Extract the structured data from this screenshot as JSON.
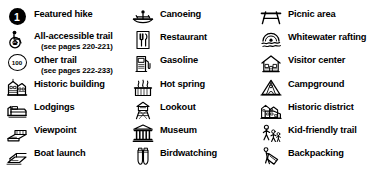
{
  "legend": {
    "background_color": "#ffffff",
    "text_color": "#000000",
    "columns": [
      {
        "name": "column-1",
        "entries": [
          {
            "icon": "featured-hike-badge-icon",
            "label": "Featured hike",
            "sublabel": "",
            "badge_text": "1",
            "y": 6
          },
          {
            "icon": "wheelchair-accessible-icon",
            "label": "All-accessible trail",
            "sublabel": "(see pages 220-221)",
            "badge_text": "",
            "y": 28
          },
          {
            "icon": "route-shield-icon",
            "label": "Other trail",
            "sublabel": "(see pages 222-233)",
            "badge_text": "100",
            "y": 52
          },
          {
            "icon": "historic-building-icon",
            "label": "Historic building",
            "sublabel": "",
            "badge_text": "",
            "y": 76
          },
          {
            "icon": "lodgings-bed-icon",
            "label": "Lodgings",
            "sublabel": "",
            "badge_text": "",
            "y": 99
          },
          {
            "icon": "viewpoint-icon",
            "label": "Viewpoint",
            "sublabel": "",
            "badge_text": "",
            "y": 122
          },
          {
            "icon": "boat-launch-icon",
            "label": "Boat launch",
            "sublabel": "",
            "badge_text": "",
            "y": 145
          }
        ]
      },
      {
        "name": "column-2",
        "entries": [
          {
            "icon": "canoeing-icon",
            "label": "Canoeing",
            "sublabel": "",
            "badge_text": "",
            "y": 6
          },
          {
            "icon": "restaurant-icon",
            "label": "Restaurant",
            "sublabel": "",
            "badge_text": "",
            "y": 29
          },
          {
            "icon": "gasoline-pump-icon",
            "label": "Gasoline",
            "sublabel": "",
            "badge_text": "",
            "y": 52
          },
          {
            "icon": "hot-spring-icon",
            "label": "Hot spring",
            "sublabel": "",
            "badge_text": "",
            "y": 76
          },
          {
            "icon": "lookout-tower-icon",
            "label": "Lookout",
            "sublabel": "",
            "badge_text": "",
            "y": 99
          },
          {
            "icon": "museum-icon",
            "label": "Museum",
            "sublabel": "",
            "badge_text": "",
            "y": 122
          },
          {
            "icon": "birdwatching-binoculars-icon",
            "label": "Birdwatching",
            "sublabel": "",
            "badge_text": "",
            "y": 145
          }
        ]
      },
      {
        "name": "column-3",
        "entries": [
          {
            "icon": "picnic-area-icon",
            "label": "Picnic area",
            "sublabel": "",
            "badge_text": "",
            "y": 6
          },
          {
            "icon": "whitewater-rafting-icon",
            "label": "Whitewater rafting",
            "sublabel": "",
            "badge_text": "",
            "y": 29
          },
          {
            "icon": "visitor-center-icon",
            "label": "Visitor center",
            "sublabel": "",
            "badge_text": "",
            "y": 52
          },
          {
            "icon": "campground-tent-icon",
            "label": "Campground",
            "sublabel": "",
            "badge_text": "",
            "y": 76
          },
          {
            "icon": "historic-district-icon",
            "label": "Historic district",
            "sublabel": "",
            "badge_text": "",
            "y": 99
          },
          {
            "icon": "kid-friendly-trail-icon",
            "label": "Kid-friendly trail",
            "sublabel": "",
            "badge_text": "",
            "y": 122
          },
          {
            "icon": "backpacking-icon",
            "label": "Backpacking",
            "sublabel": "",
            "badge_text": "",
            "y": 145
          }
        ]
      }
    ]
  }
}
